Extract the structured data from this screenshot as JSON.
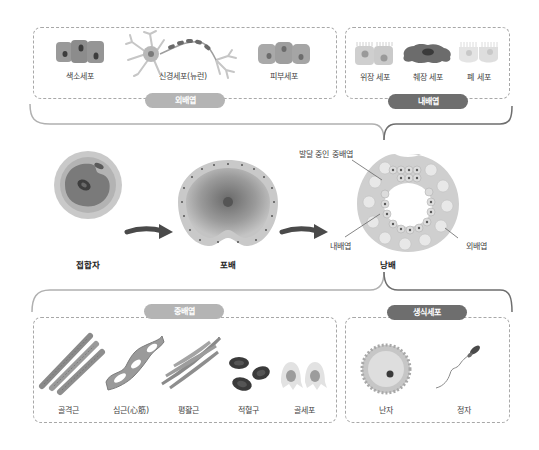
{
  "ectoderm": {
    "badge": "외배엽",
    "cells": [
      {
        "label": "색소세포"
      },
      {
        "label": "신경세포(뉴런)"
      },
      {
        "label": "피부세포"
      }
    ]
  },
  "endoderm": {
    "badge": "내배엽",
    "cells": [
      {
        "label": "위장 세포"
      },
      {
        "label": "췌장 세포"
      },
      {
        "label": "폐 세포"
      }
    ]
  },
  "development": {
    "stages": [
      {
        "label": "접합자"
      },
      {
        "label": "포배"
      },
      {
        "label": "낭배"
      }
    ],
    "gastrula_annotations": {
      "mesoderm_developing": "발달 중인 중배엽",
      "endoderm": "내배엽",
      "ectoderm": "외배엽"
    }
  },
  "mesoderm": {
    "badge": "중배엽",
    "cells": [
      {
        "label": "골격근"
      },
      {
        "label": "심근(心筋)"
      },
      {
        "label": "평활근"
      },
      {
        "label": "적혈구"
      },
      {
        "label": "골세포"
      }
    ]
  },
  "germ_cells": {
    "badge": "생식세포",
    "cells": [
      {
        "label": "난자"
      },
      {
        "label": "정자"
      }
    ]
  },
  "colors": {
    "badge_light": "#b4b4b4",
    "badge_dark": "#6e6e6e",
    "bracket_light": "#b0b0b0",
    "bracket_dark": "#6e6e6e",
    "dashed_border": "#a8a8a8"
  }
}
